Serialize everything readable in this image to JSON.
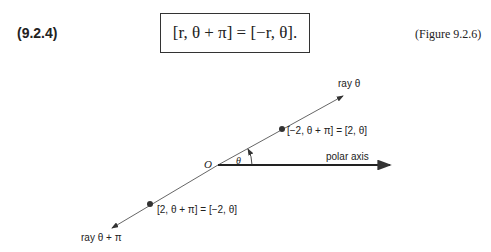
{
  "equation": {
    "number": "(9.2.4)",
    "formula": "[r, θ + π] = [−r, θ].",
    "figure_ref": "(Figure 9.2.6)"
  },
  "diagram": {
    "ray_label": "ray θ",
    "opposite_ray_label": "ray θ + π",
    "polar_axis_label": "polar axis",
    "origin_label": "O",
    "angle_label": "θ",
    "upper_point_label": "[−2, θ + π] = [2, θ]",
    "lower_point_label": "[2, θ + π] = [−2, θ]"
  }
}
